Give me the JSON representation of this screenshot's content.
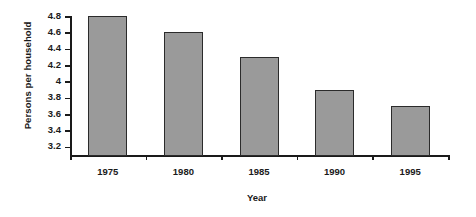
{
  "chart_data": {
    "type": "bar",
    "title": "",
    "subtitle": "",
    "categories": [
      "1975",
      "1980",
      "1985",
      "1990",
      "1995"
    ],
    "values": [
      4.8,
      4.6,
      4.3,
      3.9,
      3.7
    ],
    "xlabel": "Year",
    "ylabel": "Persons per household",
    "ylim": [
      3.1,
      4.8
    ],
    "ytick_labels": [
      "4.8",
      "4.6",
      "4.4",
      "4.2",
      "4",
      "3.8",
      "3.6",
      "3.4",
      "3.2"
    ],
    "ytick_values": [
      4.8,
      4.6,
      4.4,
      4.2,
      4.0,
      3.8,
      3.6,
      3.4,
      3.2
    ],
    "grid": false,
    "legend": false,
    "legend_position": "none",
    "bar_color": "#9a9a9a",
    "bar_edge_color": "#2b2b2b",
    "axis_color": "#1a1a1a",
    "background_color": "#ffffff"
  }
}
